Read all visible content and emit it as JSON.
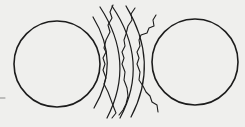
{
  "diagram": {
    "colors": {
      "background": "#efefed",
      "stroke": "#1c1c1c"
    },
    "circles": [
      {
        "name": "left-circle",
        "cx": 57,
        "cy": 64,
        "r": 43
      },
      {
        "name": "right-circle",
        "cx": 195,
        "cy": 62,
        "r": 43
      }
    ],
    "arcs": [
      {
        "name": "arc-1",
        "d": "M93,17 Q121,63 94,108"
      },
      {
        "name": "arc-2",
        "d": "M100,7 Q136,62 107,118"
      },
      {
        "name": "arc-3",
        "d": "M112,6 Q150,62 120,118"
      },
      {
        "name": "arc-4",
        "d": "M126,6 Q160,62 131,117"
      }
    ],
    "wavy_lines": [
      {
        "name": "wavy-line-1",
        "d": "M113,5 L110,12 L112,18 L108,25 L110,32 L106,40 L104,48 L106,52 L103,58 L105,64 L103,70 L106,78 L104,84 L108,92 L111,100 L114,108 L116,113 L112,118"
      },
      {
        "name": "wavy-line-2",
        "d": "M135,8 L131,14 L132,20 L128,26 L126,34 L124,40 L125,46 L122,52 L124,58 L122,64 L125,72 L124,80 L127,88 L128,96 L126,104 L123,110 L119,115"
      },
      {
        "name": "wavy-line-3",
        "d": "M156,15 L153,20 L154,26 L149,28 L147,33 L141,35 L139,40 L140,46 L137,52 L139,58 L137,64 L140,72 L139,80 L143,86 L146,92 L150,96 L152,102 L157,105 L158,112"
      }
    ],
    "marks": [
      {
        "name": "left-dash",
        "x1": 0,
        "y1": 98,
        "x2": 5,
        "y2": 98
      }
    ]
  }
}
